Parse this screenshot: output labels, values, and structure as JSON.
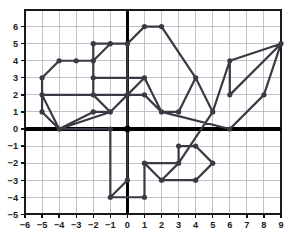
{
  "chart_data": {
    "type": "line",
    "title": "",
    "xlabel": "",
    "ylabel": "",
    "xlim": [
      -6,
      9
    ],
    "ylim": [
      -5,
      7
    ],
    "grid": true,
    "legend": false,
    "legend_position": "none",
    "x_ticks": [
      -6,
      -5,
      -4,
      -3,
      -2,
      -1,
      0,
      1,
      2,
      3,
      4,
      5,
      6,
      7,
      8,
      9
    ],
    "y_ticks": [
      -5,
      -4,
      -3,
      -2,
      -1,
      0,
      1,
      2,
      3,
      4,
      5,
      6
    ],
    "x_tick_labels": [
      "−6",
      "−5",
      "−4",
      "−3",
      "−2",
      "−1",
      "0",
      "1",
      "2",
      "3",
      "4",
      "5",
      "6",
      "7",
      "8",
      "9"
    ],
    "y_tick_labels": [
      "−5",
      "−4",
      "−3",
      "−2",
      "−1",
      "0",
      "1",
      "2",
      "3",
      "4",
      "5",
      "6"
    ],
    "series": [
      {
        "name": "connect-the-dots path",
        "color": "#3a3a44",
        "marker": "circle",
        "points": [
          [
            -5,
            3
          ],
          [
            -5,
            2
          ],
          [
            -4,
            0
          ],
          [
            -1,
            0
          ],
          [
            -1,
            -4
          ],
          [
            0,
            -3
          ],
          [
            0,
            5
          ],
          [
            -1,
            5
          ],
          [
            -2,
            5
          ],
          [
            -2,
            4
          ],
          [
            -2,
            3
          ],
          [
            1,
            3
          ],
          [
            0,
            2
          ],
          [
            -2,
            2
          ],
          [
            -5,
            2
          ],
          [
            -5,
            1
          ],
          [
            -4,
            0
          ],
          [
            -1,
            1
          ],
          [
            -2,
            2
          ],
          [
            -2,
            4
          ],
          [
            -1,
            5
          ],
          [
            0,
            5
          ],
          [
            1,
            6
          ],
          [
            2,
            6
          ],
          [
            4,
            3
          ],
          [
            5,
            1
          ],
          [
            6,
            4
          ],
          [
            6,
            2
          ],
          [
            9,
            5
          ],
          [
            8,
            2
          ],
          [
            6,
            0
          ],
          [
            2,
            1
          ],
          [
            1,
            2
          ],
          [
            0,
            2
          ],
          [
            -1,
            1
          ],
          [
            -2,
            1
          ],
          [
            -4,
            0
          ],
          [
            -5,
            1
          ],
          [
            -5,
            3
          ],
          [
            -4,
            4
          ],
          [
            -3,
            4
          ],
          [
            -2,
            4
          ],
          [
            -2,
            3
          ],
          [
            1,
            3
          ],
          [
            2,
            1
          ],
          [
            3,
            1
          ],
          [
            4,
            3
          ],
          [
            2,
            6
          ],
          [
            1,
            6
          ],
          [
            0,
            5
          ],
          [
            0,
            -3
          ],
          [
            -1,
            -4
          ],
          [
            1,
            -4
          ],
          [
            1,
            -2
          ],
          [
            2,
            -3
          ],
          [
            3,
            -2
          ],
          [
            3,
            -1
          ],
          [
            4,
            -1
          ],
          [
            5,
            -2
          ],
          [
            4,
            -3
          ],
          [
            2,
            -3
          ],
          [
            1,
            -2
          ],
          [
            3,
            -2
          ],
          [
            5,
            1
          ],
          [
            6,
            4
          ],
          [
            9,
            5
          ]
        ]
      }
    ]
  },
  "axes": {
    "origin_label": "0",
    "x_axis_name": "x-axis",
    "y_axis_name": "y-axis"
  }
}
